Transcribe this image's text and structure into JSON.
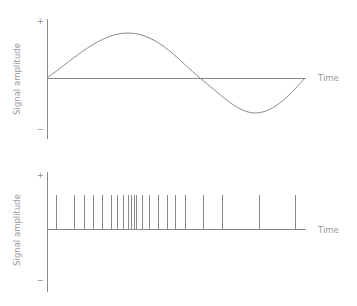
{
  "chart_data": [
    {
      "type": "line",
      "title": "",
      "description": "Continuous signal: one period of a sine-like wave",
      "xlabel": "Time",
      "ylabel": "Signal amplitude",
      "y_tick_labels": [
        "+",
        "−"
      ],
      "grid": false,
      "legend": null,
      "series": [
        {
          "name": "signal",
          "x": [
            0,
            0.25,
            0.5,
            0.75,
            1.0
          ],
          "values": [
            0,
            1.0,
            0,
            -0.78,
            0
          ]
        }
      ],
      "ylim": [
        -1.3,
        1.3
      ]
    },
    {
      "type": "bar",
      "title": "",
      "description": "Spike train: impulses of equal amplitude at irregular times, densest near the middle",
      "xlabel": "Time",
      "ylabel": "Signal amplitude",
      "y_tick_labels": [
        "+",
        "−"
      ],
      "grid": false,
      "legend": null,
      "spike_times": [
        0.035,
        0.106,
        0.142,
        0.177,
        0.213,
        0.248,
        0.272,
        0.295,
        0.311,
        0.323,
        0.335,
        0.343,
        0.366,
        0.394,
        0.429,
        0.465,
        0.496,
        0.531,
        0.602,
        0.677,
        0.819,
        0.957
      ],
      "spike_amplitude": 1.0,
      "ylim": [
        -1.5,
        1.5
      ]
    }
  ],
  "labels": {
    "top_ylabel": "Signal amplitude",
    "top_xlabel": "Time",
    "top_plus": "+",
    "top_minus": "−",
    "bottom_ylabel": "Signal amplitude",
    "bottom_xlabel": "Time",
    "bottom_plus": "+",
    "bottom_minus": "−"
  },
  "colors": {
    "line": "#8a8a8a",
    "text": "#9a9a9a"
  }
}
